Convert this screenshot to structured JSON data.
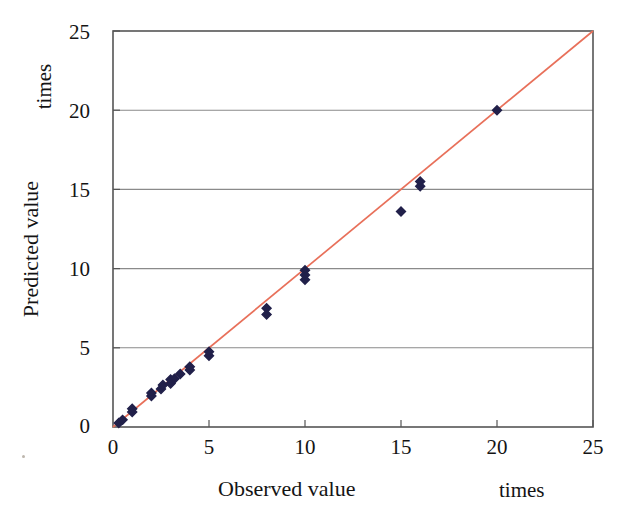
{
  "chart_data": {
    "type": "scatter",
    "title": "",
    "xlabel": "Observed value",
    "ylabel": "Predicted value",
    "x_unit": "times",
    "y_unit": "times",
    "xlim": [
      0,
      25
    ],
    "ylim": [
      0,
      25
    ],
    "xticks": [
      0,
      5,
      10,
      15,
      20,
      25
    ],
    "yticks": [
      0,
      5,
      10,
      15,
      20,
      25
    ],
    "xtick_labels": [
      "0",
      "5",
      "10",
      "15",
      "20",
      "25"
    ],
    "ytick_labels": [
      "0",
      "5",
      "10",
      "15",
      "20",
      "25"
    ],
    "grid": "horizontal",
    "legend": "none",
    "marker": {
      "shape": "diamond",
      "color": "#21204a",
      "size": 9
    },
    "reference_line": {
      "name": "y = x identity line",
      "color": "#e8705a",
      "from": [
        0,
        0
      ],
      "to": [
        25,
        25
      ],
      "slope": 1,
      "intercept": 0
    },
    "series": [
      {
        "name": "Observed vs Predicted",
        "points": [
          [
            0.3,
            0.25
          ],
          [
            0.5,
            0.45
          ],
          [
            1.0,
            0.95
          ],
          [
            1.0,
            1.15
          ],
          [
            2.0,
            1.95
          ],
          [
            2.0,
            2.15
          ],
          [
            2.5,
            2.4
          ],
          [
            2.6,
            2.65
          ],
          [
            3.0,
            2.75
          ],
          [
            3.0,
            3.0
          ],
          [
            3.2,
            3.05
          ],
          [
            3.5,
            3.35
          ],
          [
            4.0,
            3.6
          ],
          [
            4.0,
            3.8
          ],
          [
            5.0,
            4.5
          ],
          [
            5.0,
            4.75
          ],
          [
            8.0,
            7.1
          ],
          [
            8.0,
            7.5
          ],
          [
            10.0,
            9.3
          ],
          [
            10.0,
            9.6
          ],
          [
            10.0,
            9.9
          ],
          [
            15.0,
            13.6
          ],
          [
            16.0,
            15.2
          ],
          [
            16.0,
            15.5
          ],
          [
            20.0,
            20.0
          ]
        ]
      }
    ]
  },
  "axes": {
    "y_ticks": [
      {
        "label": "25",
        "value": 25
      },
      {
        "label": "20",
        "value": 20
      },
      {
        "label": "15",
        "value": 15
      },
      {
        "label": "10",
        "value": 10
      },
      {
        "label": "5",
        "value": 5
      },
      {
        "label": "0",
        "value": 0
      }
    ],
    "x_ticks": [
      {
        "label": "0",
        "value": 0
      },
      {
        "label": "5",
        "value": 5
      },
      {
        "label": "10",
        "value": 10
      },
      {
        "label": "15",
        "value": 15
      },
      {
        "label": "20",
        "value": 20
      },
      {
        "label": "25",
        "value": 25
      }
    ],
    "x_axis_title": "Observed value",
    "y_axis_title": "Predicted value",
    "x_axis_unit": "times",
    "y_axis_unit": "times"
  },
  "colors": {
    "marker": "#21204a",
    "line": "#e8705a",
    "grid": "#8a8a8a",
    "frame": "#555555",
    "background": "#ffffff",
    "text": "#141414"
  }
}
